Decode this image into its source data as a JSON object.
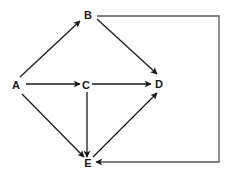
{
  "diagram": {
    "type": "directed-graph",
    "colors": {
      "line": "#1a1a1a",
      "loop_line": "#555555",
      "background": "#ffffff"
    },
    "nodes": [
      {
        "id": "A",
        "label": "A",
        "x": 16,
        "y": 85
      },
      {
        "id": "B",
        "label": "B",
        "x": 88,
        "y": 15
      },
      {
        "id": "C",
        "label": "C",
        "x": 86,
        "y": 85
      },
      {
        "id": "D",
        "label": "D",
        "x": 159,
        "y": 84
      },
      {
        "id": "E",
        "label": "E",
        "x": 88,
        "y": 163
      }
    ],
    "edges": [
      {
        "from": "A",
        "to": "B"
      },
      {
        "from": "A",
        "to": "C"
      },
      {
        "from": "A",
        "to": "E"
      },
      {
        "from": "B",
        "to": "D"
      },
      {
        "from": "B",
        "to": "E",
        "routing": "orthogonal-right"
      },
      {
        "from": "C",
        "to": "D"
      },
      {
        "from": "C",
        "to": "E"
      },
      {
        "from": "E",
        "to": "D"
      }
    ]
  }
}
